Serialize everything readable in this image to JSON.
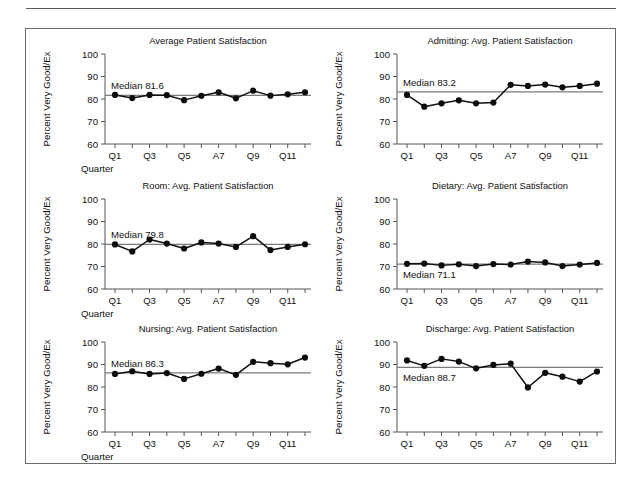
{
  "figure": {
    "y_axis_label": "Percent Very Good/Ex",
    "x_axis_label": "Quarter",
    "y_ticks": [
      "100",
      "90",
      "80",
      "70",
      "60"
    ],
    "x_ticks": [
      "Q1",
      "Q3",
      "Q5",
      "A7",
      "Q9",
      "Q11"
    ],
    "ylim": [
      60,
      100
    ],
    "colors": {
      "line": "#101010",
      "marker": "#0c0c0c",
      "median": "#7a7a7a",
      "axis": "#555555",
      "frame": "#6a6a6a",
      "rule": "#585858"
    }
  },
  "chart_data": [
    {
      "type": "line",
      "title": "Average Patient Satisfaction",
      "xlabel": "Quarter",
      "ylabel": "Percent Very Good/Ex",
      "ylim": [
        60,
        100
      ],
      "grid": false,
      "legend": "none",
      "x": [
        1,
        2,
        3,
        4,
        5,
        6,
        7,
        8,
        9,
        10,
        11,
        12
      ],
      "categories": [
        "Q1",
        "Q2",
        "Q3",
        "Q4",
        "Q5",
        "Q6",
        "A7",
        "Q8",
        "Q9",
        "Q10",
        "Q11",
        "Q12"
      ],
      "values": [
        81.8,
        80.4,
        81.8,
        81.7,
        79.5,
        81.4,
        83.0,
        80.3,
        83.7,
        81.5,
        82.1,
        83.0
      ],
      "median": 81.6,
      "median_label": "Median 81.6",
      "axis_ticks_x": [
        "Q1",
        "Q3",
        "Q5",
        "A7",
        "Q9",
        "Q11"
      ],
      "axis_ticks_y": [
        "100",
        "90",
        "80",
        "70",
        "60"
      ]
    },
    {
      "type": "line",
      "title": "Admitting: Avg. Patient Satisfaction",
      "xlabel": "Quarter",
      "ylabel": "Percent Very Good/Ex",
      "ylim": [
        60,
        100
      ],
      "grid": false,
      "legend": "none",
      "x": [
        1,
        2,
        3,
        4,
        5,
        6,
        7,
        8,
        9,
        10,
        11,
        12
      ],
      "categories": [
        "Q1",
        "Q2",
        "Q3",
        "Q4",
        "Q5",
        "Q6",
        "A7",
        "Q8",
        "Q9",
        "Q10",
        "Q11",
        "Q12"
      ],
      "values": [
        81.8,
        76.6,
        78.1,
        79.4,
        78.1,
        78.4,
        86.3,
        85.8,
        86.4,
        85.2,
        85.8,
        86.8
      ],
      "median": 83.2,
      "median_label": "Median 83.2",
      "axis_ticks_x": [
        "Q1",
        "Q3",
        "Q5",
        "A7",
        "Q9",
        "Q11"
      ],
      "axis_ticks_y": [
        "100",
        "90",
        "80",
        "70",
        "60"
      ]
    },
    {
      "type": "line",
      "title": "Room: Avg. Patient Satisfaction",
      "xlabel": "Quarter",
      "ylabel": "Percent Very Good/Ex",
      "ylim": [
        60,
        100
      ],
      "grid": false,
      "legend": "none",
      "x": [
        1,
        2,
        3,
        4,
        5,
        6,
        7,
        8,
        9,
        10,
        11,
        12
      ],
      "categories": [
        "Q1",
        "Q2",
        "Q3",
        "Q4",
        "Q5",
        "Q6",
        "A7",
        "Q8",
        "Q9",
        "Q10",
        "Q11",
        "Q12"
      ],
      "values": [
        79.8,
        76.7,
        82.0,
        80.2,
        78.0,
        80.7,
        80.2,
        78.7,
        83.5,
        77.3,
        78.7,
        79.9
      ],
      "median": 79.8,
      "median_label": "Median 79.8",
      "axis_ticks_x": [
        "Q1",
        "Q3",
        "Q5",
        "A7",
        "Q9",
        "Q11"
      ],
      "axis_ticks_y": [
        "100",
        "90",
        "80",
        "70",
        "60"
      ]
    },
    {
      "type": "line",
      "title": "Dietary: Avg. Patient Satisfaction",
      "xlabel": "Quarter",
      "ylabel": "Percent Very Good/Ex",
      "ylim": [
        60,
        100
      ],
      "grid": false,
      "legend": "none",
      "x": [
        1,
        2,
        3,
        4,
        5,
        6,
        7,
        8,
        9,
        10,
        11,
        12
      ],
      "categories": [
        "Q1",
        "Q2",
        "Q3",
        "Q4",
        "Q5",
        "Q6",
        "A7",
        "Q8",
        "Q9",
        "Q10",
        "Q11",
        "Q12"
      ],
      "values": [
        71.2,
        71.3,
        70.5,
        71.0,
        70.2,
        71.1,
        70.9,
        72.2,
        71.8,
        70.2,
        70.9,
        71.6
      ],
      "median": 71.1,
      "median_label": "Median 71.1",
      "axis_ticks_x": [
        "Q1",
        "Q3",
        "Q5",
        "A7",
        "Q9",
        "Q11"
      ],
      "axis_ticks_y": [
        "100",
        "90",
        "80",
        "70",
        "60"
      ]
    },
    {
      "type": "line",
      "title": "Nursing: Avg. Patient Satisfaction",
      "xlabel": "Quarter",
      "ylabel": "Percent Very Good/Ex",
      "ylim": [
        60,
        100
      ],
      "grid": false,
      "legend": "none",
      "x": [
        1,
        2,
        3,
        4,
        5,
        6,
        7,
        8,
        9,
        10,
        11,
        12
      ],
      "categories": [
        "Q1",
        "Q2",
        "Q3",
        "Q4",
        "Q5",
        "Q6",
        "A7",
        "Q8",
        "Q9",
        "Q10",
        "Q11",
        "Q12"
      ],
      "values": [
        85.8,
        87.0,
        85.8,
        86.2,
        83.6,
        85.9,
        88.2,
        85.4,
        91.2,
        90.6,
        90.1,
        93.1
      ],
      "median": 86.3,
      "median_label": "Median 86.3",
      "axis_ticks_x": [
        "Q1",
        "Q3",
        "Q5",
        "A7",
        "Q9",
        "Q11"
      ],
      "axis_ticks_y": [
        "100",
        "90",
        "80",
        "70",
        "60"
      ]
    },
    {
      "type": "line",
      "title": "Discharge: Avg. Patient Satisfaction",
      "xlabel": "Quarter",
      "ylabel": "Percent Very Good/Ex",
      "ylim": [
        60,
        100
      ],
      "grid": false,
      "legend": "none",
      "x": [
        1,
        2,
        3,
        4,
        5,
        6,
        7,
        8,
        9,
        10,
        11,
        12
      ],
      "categories": [
        "Q1",
        "Q2",
        "Q3",
        "Q4",
        "Q5",
        "Q6",
        "A7",
        "Q8",
        "Q9",
        "Q10",
        "Q11",
        "Q12"
      ],
      "values": [
        91.8,
        89.4,
        92.5,
        91.3,
        88.3,
        89.8,
        90.4,
        79.8,
        86.3,
        84.6,
        82.4,
        86.9
      ],
      "median": 88.7,
      "median_label": "Median 88.7",
      "axis_ticks_x": [
        "Q1",
        "Q3",
        "Q5",
        "A7",
        "Q9",
        "Q11"
      ],
      "axis_ticks_y": [
        "100",
        "90",
        "80",
        "70",
        "60"
      ]
    }
  ],
  "panels": [
    {
      "index": 0,
      "show_xlabel": true,
      "median_label_pos": "above"
    },
    {
      "index": 1,
      "show_xlabel": false,
      "median_label_pos": "above"
    },
    {
      "index": 2,
      "show_xlabel": true,
      "median_label_pos": "above"
    },
    {
      "index": 3,
      "show_xlabel": false,
      "median_label_pos": "below"
    },
    {
      "index": 4,
      "show_xlabel": true,
      "median_label_pos": "above"
    },
    {
      "index": 5,
      "show_xlabel": false,
      "median_label_pos": "below"
    }
  ]
}
